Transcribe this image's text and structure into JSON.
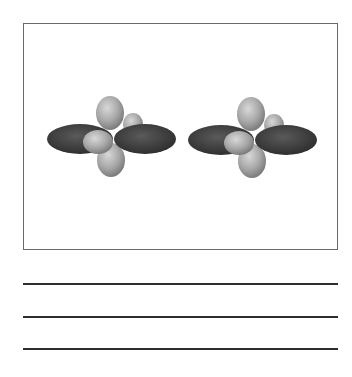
{
  "figure": {
    "frame": {
      "x": 23,
      "y": 23,
      "width": 315,
      "height": 227,
      "border_color": "#6a6a6a"
    },
    "orbital_sets": [
      {
        "label": "orbital-set-left",
        "center": {
          "x": 111,
          "y": 139
        },
        "lobes": [
          {
            "name": "back-upper-right-lobe",
            "shade": "light",
            "cx": 22,
            "cy": -15,
            "rx": 10,
            "ry": 11
          },
          {
            "name": "top-lobe",
            "shade": "light",
            "cx": -1,
            "cy": -26,
            "rx": 14,
            "ry": 17
          },
          {
            "name": "left-dark-lobe",
            "shade": "dark",
            "cx": -31,
            "cy": 0,
            "rx": 33,
            "ry": 15
          },
          {
            "name": "bottom-lobe",
            "shade": "light",
            "cx": 0,
            "cy": 21,
            "rx": 14,
            "ry": 17
          },
          {
            "name": "right-dark-lobe",
            "shade": "dark",
            "cx": 34,
            "cy": 0,
            "rx": 31,
            "ry": 15
          },
          {
            "name": "front-lower-left-lobe",
            "shade": "light",
            "cx": -13,
            "cy": 3,
            "rx": 15,
            "ry": 12
          }
        ]
      },
      {
        "label": "orbital-set-right",
        "center": {
          "x": 252,
          "y": 140
        },
        "lobes": [
          {
            "name": "back-upper-right-lobe",
            "shade": "light",
            "cx": 22,
            "cy": -15,
            "rx": 10,
            "ry": 11
          },
          {
            "name": "top-lobe",
            "shade": "light",
            "cx": -1,
            "cy": -26,
            "rx": 14,
            "ry": 17
          },
          {
            "name": "left-dark-lobe",
            "shade": "dark",
            "cx": -31,
            "cy": 0,
            "rx": 33,
            "ry": 15
          },
          {
            "name": "bottom-lobe",
            "shade": "light",
            "cx": 0,
            "cy": 21,
            "rx": 14,
            "ry": 17
          },
          {
            "name": "right-dark-lobe",
            "shade": "dark",
            "cx": 34,
            "cy": 0,
            "rx": 31,
            "ry": 15
          },
          {
            "name": "front-lower-left-lobe",
            "shade": "light",
            "cx": -13,
            "cy": 3,
            "rx": 15,
            "ry": 12
          }
        ]
      }
    ],
    "colors": {
      "dark_lobe_center": "#5a5a5a",
      "dark_lobe_edge": "#2f2f2f",
      "light_lobe_highlight": "#d8d8d8",
      "light_lobe_mid": "#a8a8a8",
      "light_lobe_edge": "#7c7c7c"
    }
  },
  "answer_lines": [
    {
      "y": 284
    },
    {
      "y": 317
    },
    {
      "y": 349
    }
  ]
}
